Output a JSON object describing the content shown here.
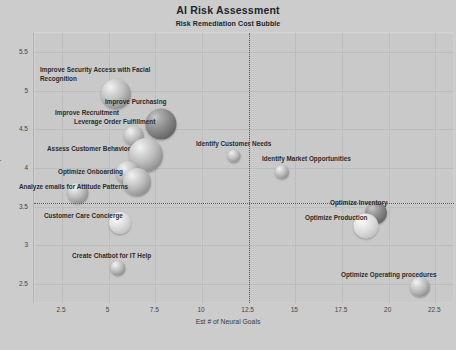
{
  "chart": {
    "title": "AI Risk Assessment",
    "subtitle": "Risk Remediation Cost Bubble"
  },
  "chart_data": {
    "type": "scatter",
    "title": "AI Risk Assessment",
    "subtitle": "Risk Remediation Cost Bubble",
    "xlabel": "Est # of Neural Goals",
    "ylabel": "Attribute Comp Rank",
    "xlim": [
      1.0,
      23.5
    ],
    "ylim": [
      2.25,
      5.75
    ],
    "xticks": [
      "2.5",
      "5",
      "7.5",
      "10",
      "12.5",
      "15",
      "17.5",
      "20",
      "22.5"
    ],
    "yticks": [
      "2.5",
      "3",
      "3.5",
      "4",
      "4.5",
      "5",
      "5.5"
    ],
    "grid": true,
    "legend": "none",
    "reference_lines": [
      {
        "orientation": "vertical",
        "value": 12.5,
        "style": "dotted"
      },
      {
        "orientation": "horizontal",
        "value": 3.55,
        "style": "dotted"
      }
    ],
    "size_meaning": "Risk remediation cost (bubble area)",
    "points": [
      {
        "label": "Improve Security Access with Facial\nRecognition",
        "x": 5.2,
        "y": 5.0,
        "size": 30,
        "shade": "mid",
        "label_x": 40,
        "label_y": 66,
        "cx": 116,
        "cy": 94,
        "d": 30
      },
      {
        "label": "Improve Purchasing",
        "x": 8.1,
        "y": 4.62,
        "size": 31,
        "shade": "dark",
        "label_x": 105,
        "label_y": 98,
        "cx": 161,
        "cy": 124,
        "d": 31
      },
      {
        "label": "Improve Recruitment",
        "x": 6.3,
        "y": 4.5,
        "size": 20,
        "shade": "mid",
        "label_x": 55,
        "label_y": 109,
        "cx": 134,
        "cy": 136,
        "d": 20
      },
      {
        "label": "Leverage Order Fulfillment",
        "x": 7.2,
        "y": 4.3,
        "size": 34,
        "shade": "mid",
        "label_x": 74,
        "label_y": 118,
        "cx": 146,
        "cy": 155,
        "d": 34
      },
      {
        "label": "Assess Customer Behavior",
        "x": 6.6,
        "y": 4.05,
        "size": 24,
        "shade": "mid",
        "label_x": 47,
        "label_y": 145,
        "cx": 128,
        "cy": 173,
        "d": 24
      },
      {
        "label": "Optimize Onboarding",
        "x": 7.0,
        "y": 3.95,
        "size": 28,
        "shade": "mid",
        "label_x": 58,
        "label_y": 168,
        "cx": 137,
        "cy": 182,
        "d": 28
      },
      {
        "label": "Analyze emails for Attitude Patterns",
        "x": 5.4,
        "y": 3.55,
        "size": 21,
        "shade": "mid",
        "label_x": 19,
        "label_y": 183,
        "cx": 78,
        "cy": 193,
        "d": 21
      },
      {
        "label": "Customer Care Concierge",
        "x": 5.9,
        "y": 3.2,
        "size": 22,
        "shade": "light",
        "label_x": 44,
        "label_y": 212,
        "cx": 120,
        "cy": 223,
        "d": 22
      },
      {
        "label": "Create Chatbot for IT Help",
        "x": 5.8,
        "y": 2.9,
        "size": 15,
        "shade": "mid",
        "label_x": 72,
        "label_y": 252,
        "cx": 118,
        "cy": 268,
        "d": 15
      },
      {
        "label": "Identify Customer Needs",
        "x": 11.7,
        "y": 4.2,
        "size": 13,
        "shade": "mid",
        "label_x": 196,
        "label_y": 140,
        "cx": 234,
        "cy": 156,
        "d": 13
      },
      {
        "label": "Identify Market Opportunities",
        "x": 14.3,
        "y": 3.95,
        "size": 14,
        "shade": "mid",
        "label_x": 262,
        "label_y": 155,
        "cx": 282,
        "cy": 172,
        "d": 14
      },
      {
        "label": "Optimize Inventory",
        "x": 19.3,
        "y": 3.42,
        "size": 22,
        "shade": "dark",
        "label_x": 330,
        "label_y": 199,
        "cx": 376,
        "cy": 213,
        "d": 22
      },
      {
        "label": "Optimize Production",
        "x": 18.6,
        "y": 3.3,
        "size": 25,
        "shade": "light",
        "label_x": 305,
        "label_y": 214,
        "cx": 366,
        "cy": 226,
        "d": 25
      },
      {
        "label": "Optimize Operating procedures",
        "x": 22.1,
        "y": 2.68,
        "size": 20,
        "shade": "mid",
        "label_x": 341,
        "label_y": 271,
        "cx": 420,
        "cy": 287,
        "d": 20
      }
    ]
  }
}
